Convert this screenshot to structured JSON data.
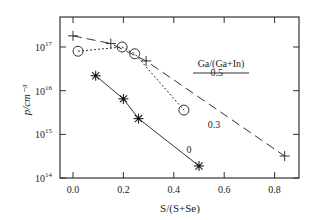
{
  "chart_data": {
    "type": "line",
    "title": "",
    "xlabel": "S/(S+Se)",
    "ylabel": "p/cm⁻³",
    "yscale": "log",
    "xlim": [
      -0.05,
      0.9
    ],
    "ylim": [
      100000000000000.0,
      4e+17
    ],
    "x_ticks": [
      "0.0",
      "0.2",
      "0.4",
      "0.6",
      "0.8"
    ],
    "y_ticks": [
      {
        "base": "10",
        "exp": "14",
        "value": 100000000000000.0
      },
      {
        "base": "10",
        "exp": "15",
        "value": 1000000000000000.0
      },
      {
        "base": "10",
        "exp": "16",
        "value": 1e+16
      },
      {
        "base": "10",
        "exp": "17",
        "value": 1e+17
      }
    ],
    "grid": false,
    "legend_title": "Ga/(Ga+In)",
    "series": [
      {
        "name": "0.5",
        "marker": "plus",
        "line": "dashed",
        "x": [
          0.0,
          0.15,
          0.29,
          0.84
        ],
        "y": [
          1.8e+17,
          1.2e+17,
          4.8e+16,
          320000000000000.0
        ]
      },
      {
        "name": "0.3",
        "marker": "circle",
        "line": "dotted",
        "x": [
          0.02,
          0.195,
          0.245,
          0.44
        ],
        "y": [
          8e+16,
          1e+17,
          7e+16,
          3600000000000000.0
        ]
      },
      {
        "name": "0",
        "marker": "star",
        "line": "solid",
        "x": [
          0.09,
          0.2,
          0.26,
          0.5
        ],
        "y": [
          2.2e+16,
          6500000000000000.0,
          2300000000000000.0,
          190000000000000.0
        ]
      }
    ],
    "annotations": [
      {
        "text": "0.5",
        "x": 0.57,
        "y": 2.2e+16
      },
      {
        "text": "0.3",
        "x": 0.56,
        "y": 1400000000000000.0
      },
      {
        "text": "0",
        "x": 0.46,
        "y": 380000000000000.0
      }
    ]
  }
}
